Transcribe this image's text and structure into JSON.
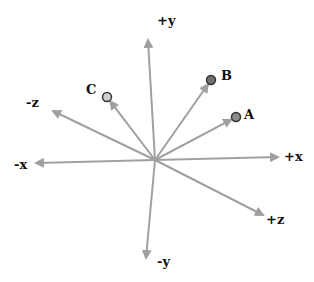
{
  "diagram": {
    "type": "3d-coordinate-axes-with-vectors",
    "origin": {
      "x": 155,
      "y": 160
    },
    "colors": {
      "axis": "#a0a0a0",
      "text": "#111111",
      "point_outline": "#333333"
    },
    "axes": [
      {
        "id": "pos-y",
        "label": "+y",
        "end": {
          "x": 148,
          "y": 40
        },
        "label_pos": {
          "x": 157,
          "y": 14
        }
      },
      {
        "id": "neg-y",
        "label": "-y",
        "end": {
          "x": 146,
          "y": 258
        },
        "label_pos": {
          "x": 157,
          "y": 255
        }
      },
      {
        "id": "pos-x",
        "label": "+x",
        "end": {
          "x": 278,
          "y": 157
        },
        "label_pos": {
          "x": 284,
          "y": 150
        }
      },
      {
        "id": "neg-x",
        "label": "-x",
        "end": {
          "x": 36,
          "y": 163
        },
        "label_pos": {
          "x": 14,
          "y": 158
        }
      },
      {
        "id": "pos-z",
        "label": "+z",
        "end": {
          "x": 263,
          "y": 215
        },
        "label_pos": {
          "x": 266,
          "y": 213
        }
      },
      {
        "id": "neg-z",
        "label": "-z",
        "end": {
          "x": 53,
          "y": 111
        },
        "label_pos": {
          "x": 26,
          "y": 96
        }
      }
    ],
    "points": [
      {
        "id": "A",
        "label": "A",
        "x": 236,
        "y": 117,
        "fill": "#8c8c8c",
        "label_pos": {
          "x": 244,
          "y": 108
        }
      },
      {
        "id": "B",
        "label": "B",
        "x": 211,
        "y": 80,
        "fill": "#707070",
        "label_pos": {
          "x": 221,
          "y": 69
        }
      },
      {
        "id": "C",
        "label": "C",
        "x": 107,
        "y": 97,
        "fill": "#cfcfcf",
        "label_pos": {
          "x": 86,
          "y": 83
        }
      }
    ]
  }
}
